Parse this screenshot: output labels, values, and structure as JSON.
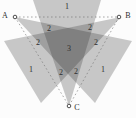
{
  "diagram": {
    "nodes": [
      {
        "id": "A",
        "label": "A"
      },
      {
        "id": "B",
        "label": "B"
      },
      {
        "id": "C",
        "label": "C"
      }
    ],
    "region_labels": [
      {
        "id": "top-single",
        "text": "1"
      },
      {
        "id": "bottom-left-single",
        "text": "1"
      },
      {
        "id": "bottom-right-single",
        "text": "1"
      },
      {
        "id": "upper-left-double",
        "text": "2"
      },
      {
        "id": "upper-right-double",
        "text": "2"
      },
      {
        "id": "mid-left-double",
        "text": "2"
      },
      {
        "id": "mid-right-double",
        "text": "2"
      },
      {
        "id": "lower-left-double",
        "text": "2"
      },
      {
        "id": "lower-right-double",
        "text": "2"
      },
      {
        "id": "center-triple",
        "text": "3"
      }
    ],
    "colors": {
      "background": "#fcfcfc",
      "beam_gray_single": "#c4c4c4",
      "beam_gray_double": "#9b9b9b",
      "beam_gray_triple": "#7d7d7d",
      "dash_line": "#6e6e6e",
      "label_text": "#2e2e2e"
    }
  }
}
